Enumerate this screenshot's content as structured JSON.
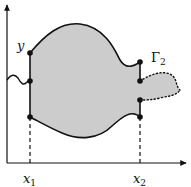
{
  "diagram": {
    "type": "shaded-domain-between-curves",
    "colors": {
      "fill": "#cccccc",
      "stroke": "#111111",
      "background": "#ffffff"
    },
    "axes": {
      "x_arrow": true,
      "y_arrow": true
    },
    "labels": {
      "y": "y",
      "gamma": "Γ",
      "gamma_sub": "2",
      "x1": "x",
      "x1_sub": "1",
      "x2": "x",
      "x2_sub": "2"
    },
    "points": {
      "x1_top": [
        30,
        53
      ],
      "x1_mid": [
        30,
        81
      ],
      "x1_bottom": [
        30,
        117
      ],
      "x2_top": [
        140,
        62
      ],
      "x2_upper_mid": [
        140,
        81
      ],
      "x2_lower_mid": [
        140,
        100
      ],
      "x2_bottom": [
        140,
        117
      ]
    },
    "features": {
      "wavy_inlet_left": true,
      "dotted_outlet_right": true,
      "dashed_verticals": [
        "x1",
        "x2"
      ]
    }
  }
}
